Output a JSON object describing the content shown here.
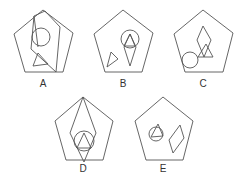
{
  "figure": {
    "stroke_color": "#555555",
    "options": [
      {
        "label": "A",
        "label_pos": [
          43,
          79
        ]
      },
      {
        "label": "B",
        "label_pos": [
          123,
          79
        ]
      },
      {
        "label": "C",
        "label_pos": [
          203,
          79
        ]
      },
      {
        "label": "D",
        "label_pos": [
          83,
          164
        ]
      },
      {
        "label": "E",
        "label_pos": [
          163,
          164
        ]
      }
    ]
  }
}
